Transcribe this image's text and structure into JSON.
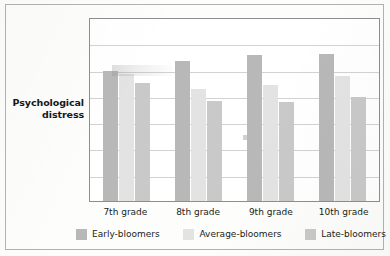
{
  "figure": {
    "y_axis_label_line1": "Psychological",
    "y_axis_label_line2": "distress"
  },
  "colors": {
    "early_bloomers": "#b8b8b8",
    "average_bloomers": "#e3e3e3",
    "late_bloomers": "#c9c9c9",
    "gridline": "#d2d2d2",
    "plot_border": "#8e8e8e",
    "frame_border": "#b2b2b2",
    "page_background": "#fdfdfb"
  },
  "legend": {
    "position": "bottom",
    "items": [
      {
        "label": "Early-bloomers",
        "color": "#b8b8b8"
      },
      {
        "label": "Average-bloomers",
        "color": "#e3e3e3"
      },
      {
        "label": "Late-bloomers",
        "color": "#c9c9c9"
      }
    ]
  },
  "x_labels": [
    "7th grade",
    "8th grade",
    "9th grade",
    "10th grade"
  ],
  "chart_data": {
    "type": "bar",
    "title": "",
    "xlabel": "",
    "ylabel": "Psychological distress",
    "categories": [
      "7th grade",
      "8th grade",
      "9th grade",
      "10th grade"
    ],
    "series": [
      {
        "name": "Early-bloomers",
        "color": "#b8b8b8",
        "values": [
          5.0,
          5.4,
          5.6,
          5.65
        ]
      },
      {
        "name": "Average-bloomers",
        "color": "#e3e3e3",
        "values": [
          4.9,
          4.3,
          4.45,
          4.8
        ]
      },
      {
        "name": "Late-bloomers",
        "color": "#c9c9c9",
        "values": [
          4.55,
          3.85,
          3.8,
          4.0
        ]
      }
    ],
    "ylim": [
      0,
      7
    ],
    "y_tick_labels": [],
    "gridlines": {
      "horizontal": true,
      "count": 6,
      "vertical": false
    },
    "legend_position": "bottom"
  }
}
